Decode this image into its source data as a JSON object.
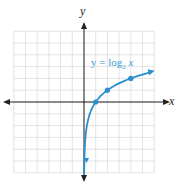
{
  "chart_data": {
    "type": "line",
    "title": "",
    "xlabel": "x",
    "ylabel": "y",
    "xlim": [
      -6,
      6
    ],
    "ylim": [
      -6,
      6
    ],
    "grid": true,
    "series": [
      {
        "name": "y = log2 x",
        "function": "log2(x)",
        "color": "#2a8fcf",
        "marked_points": [
          [
            1,
            0
          ],
          [
            2,
            1
          ],
          [
            4,
            2
          ]
        ],
        "x": [
          0.02,
          0.05,
          0.125,
          0.25,
          0.5,
          1,
          2,
          4,
          5.7
        ],
        "values": [
          -5.64,
          -4.32,
          -3,
          -2,
          -1,
          0,
          1,
          2,
          2.51
        ]
      }
    ],
    "annotations": [
      {
        "text": "y = log2 x",
        "x": 2,
        "y": 3.3
      }
    ]
  },
  "labels": {
    "x": "x",
    "y": "y",
    "eq_main": "y = log",
    "eq_sub": "2",
    "eq_var": "x"
  }
}
